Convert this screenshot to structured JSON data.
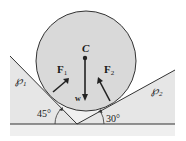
{
  "diagram": {
    "center_label": "C",
    "weight_label": "w",
    "force_left": {
      "label": "F",
      "subscript": "1"
    },
    "force_right": {
      "label": "F",
      "subscript": "2"
    },
    "plane_left": {
      "label": "℘",
      "subscript": "1"
    },
    "plane_right": {
      "label": "℘",
      "subscript": "2"
    },
    "angle_left": "45°",
    "angle_right": "30°",
    "colors": {
      "sphere_fill": "#d9d9d9",
      "plane_fill": "#e6e6e6",
      "band_fill": "#efefef",
      "line": "#333333"
    }
  }
}
